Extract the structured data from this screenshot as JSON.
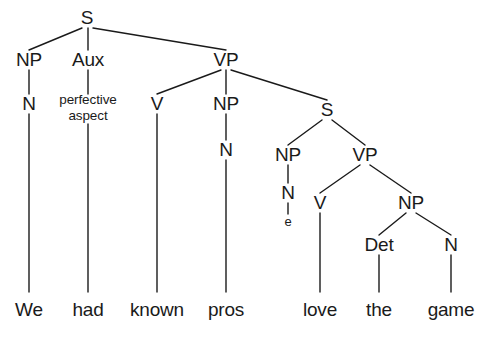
{
  "figure": {
    "type": "syntax-tree",
    "sentence": "We had known pros love the game",
    "ink_color": "#1a1a1a",
    "background_color": "#ffffff"
  },
  "nodes": {
    "s_root": {
      "label": "S",
      "x": 87,
      "y": 18
    },
    "np_subj": {
      "label": "NP",
      "x": 29,
      "y": 60
    },
    "aux": {
      "label": "Aux",
      "x": 88,
      "y": 60
    },
    "vp_main": {
      "label": "VP",
      "x": 226,
      "y": 60
    },
    "n_subj": {
      "label": "N",
      "x": 29,
      "y": 104
    },
    "aux_feat": {
      "label": "perfective\naspect",
      "line1": "perfective",
      "line2": "aspect",
      "x": 88,
      "y": 108
    },
    "v_main": {
      "label": "V",
      "x": 157,
      "y": 104
    },
    "np_obj": {
      "label": "NP",
      "x": 226,
      "y": 104
    },
    "s_embedded": {
      "label": "S",
      "x": 327,
      "y": 110
    },
    "n_obj": {
      "label": "N",
      "x": 226,
      "y": 150
    },
    "np_emb_subj": {
      "label": "NP",
      "x": 288,
      "y": 155
    },
    "vp_emb": {
      "label": "VP",
      "x": 365,
      "y": 155
    },
    "n_emb_subj": {
      "label": "N",
      "x": 288,
      "y": 193
    },
    "v_emb": {
      "label": "V",
      "x": 320,
      "y": 203
    },
    "np_emb_obj": {
      "label": "NP",
      "x": 411,
      "y": 203
    },
    "e_empty": {
      "label": "e",
      "x": 288,
      "y": 222
    },
    "det": {
      "label": "Det",
      "x": 379,
      "y": 245
    },
    "n_emb_obj": {
      "label": "N",
      "x": 451,
      "y": 245
    }
  },
  "words": [
    {
      "label": "We",
      "x": 29,
      "y": 310
    },
    {
      "label": "had",
      "x": 88,
      "y": 310
    },
    {
      "label": "known",
      "x": 157,
      "y": 310
    },
    {
      "label": "pros",
      "x": 226,
      "y": 310
    },
    {
      "label": "love",
      "x": 320,
      "y": 310
    },
    {
      "label": "the",
      "x": 379,
      "y": 310
    },
    {
      "label": "game",
      "x": 451,
      "y": 310
    }
  ],
  "edges": [
    {
      "name": "s-root-to-np-subj",
      "x1": 82,
      "y1": 28,
      "x2": 29,
      "y2": 50
    },
    {
      "name": "s-root-to-aux",
      "x1": 88,
      "y1": 28,
      "x2": 88,
      "y2": 50
    },
    {
      "name": "s-root-to-vp-main",
      "x1": 93,
      "y1": 28,
      "x2": 226,
      "y2": 50
    },
    {
      "name": "np-subj-to-n-subj",
      "x1": 29,
      "y1": 70,
      "x2": 29,
      "y2": 94
    },
    {
      "name": "aux-to-feature",
      "x1": 88,
      "y1": 70,
      "x2": 88,
      "y2": 94
    },
    {
      "name": "vp-main-to-v",
      "x1": 221,
      "y1": 70,
      "x2": 157,
      "y2": 94
    },
    {
      "name": "vp-main-to-np-obj",
      "x1": 226,
      "y1": 70,
      "x2": 226,
      "y2": 94
    },
    {
      "name": "vp-main-to-s-embedded",
      "x1": 231,
      "y1": 70,
      "x2": 327,
      "y2": 100
    },
    {
      "name": "n-subj-to-we",
      "x1": 29,
      "y1": 114,
      "x2": 29,
      "y2": 292
    },
    {
      "name": "feature-to-had",
      "x1": 88,
      "y1": 124,
      "x2": 88,
      "y2": 292
    },
    {
      "name": "v-main-to-known",
      "x1": 157,
      "y1": 114,
      "x2": 157,
      "y2": 292
    },
    {
      "name": "np-obj-to-n-obj",
      "x1": 226,
      "y1": 114,
      "x2": 226,
      "y2": 140
    },
    {
      "name": "s-embedded-to-np",
      "x1": 322,
      "y1": 120,
      "x2": 288,
      "y2": 145
    },
    {
      "name": "s-embedded-to-vp",
      "x1": 332,
      "y1": 120,
      "x2": 365,
      "y2": 145
    },
    {
      "name": "n-obj-to-pros",
      "x1": 226,
      "y1": 160,
      "x2": 226,
      "y2": 292
    },
    {
      "name": "np-emb-subj-to-n",
      "x1": 288,
      "y1": 165,
      "x2": 288,
      "y2": 183
    },
    {
      "name": "vp-emb-to-v",
      "x1": 360,
      "y1": 165,
      "x2": 320,
      "y2": 193
    },
    {
      "name": "vp-emb-to-np",
      "x1": 370,
      "y1": 165,
      "x2": 411,
      "y2": 193
    },
    {
      "name": "n-emb-subj-to-e",
      "x1": 288,
      "y1": 203,
      "x2": 288,
      "y2": 214
    },
    {
      "name": "v-emb-to-love",
      "x1": 320,
      "y1": 213,
      "x2": 320,
      "y2": 292
    },
    {
      "name": "np-emb-obj-to-det",
      "x1": 406,
      "y1": 213,
      "x2": 379,
      "y2": 235
    },
    {
      "name": "np-emb-obj-to-n",
      "x1": 416,
      "y1": 213,
      "x2": 451,
      "y2": 235
    },
    {
      "name": "det-to-the",
      "x1": 379,
      "y1": 255,
      "x2": 379,
      "y2": 292
    },
    {
      "name": "n-emb-obj-to-game",
      "x1": 451,
      "y1": 255,
      "x2": 451,
      "y2": 292
    }
  ]
}
